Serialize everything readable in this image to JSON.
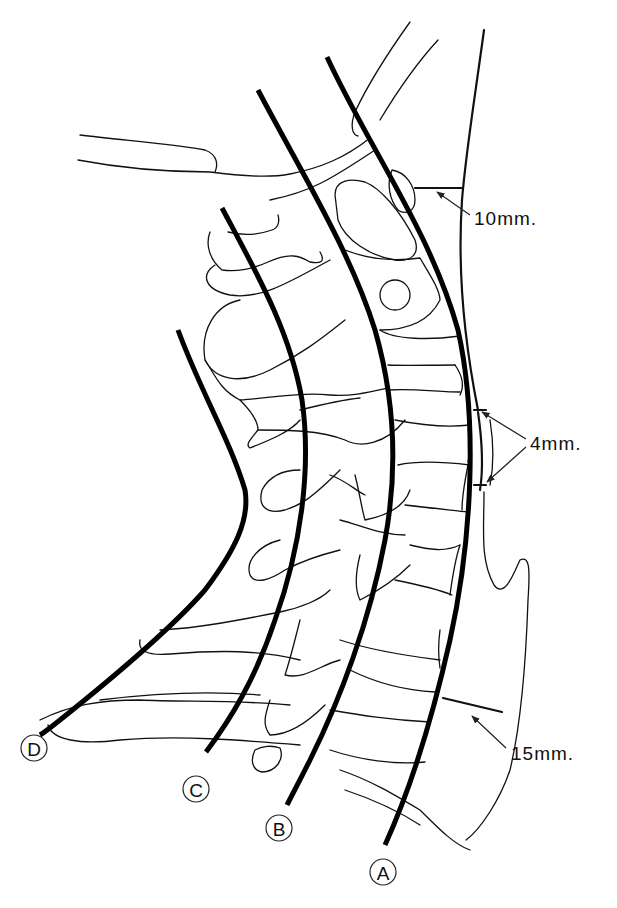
{
  "figure": {
    "reference_lines": [
      {
        "id": "A",
        "label": "A"
      },
      {
        "id": "B",
        "label": "B"
      },
      {
        "id": "C",
        "label": "C"
      },
      {
        "id": "D",
        "label": "D"
      }
    ],
    "measurements": [
      {
        "id": "upper",
        "label": "10mm."
      },
      {
        "id": "middle",
        "label": "4mm."
      },
      {
        "id": "lower",
        "label": "15mm."
      }
    ]
  }
}
